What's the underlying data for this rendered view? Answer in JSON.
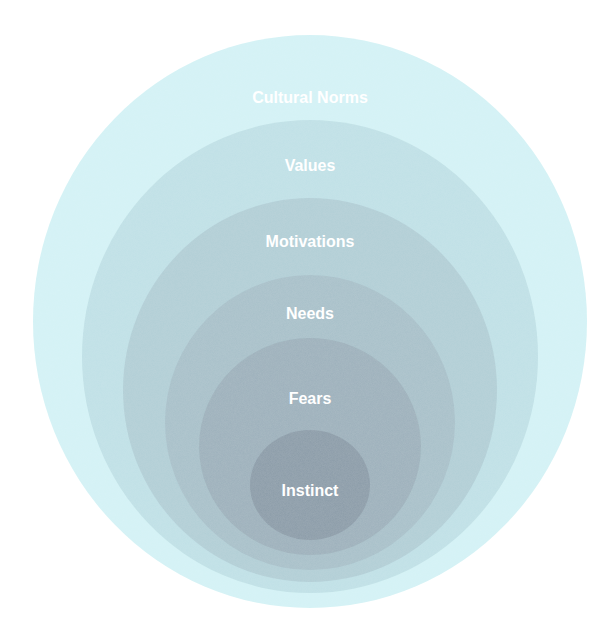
{
  "diagram": {
    "type": "nested-circles",
    "layers": [
      {
        "label": "Cultural Norms",
        "color": "#d3f2f5",
        "cx": 310,
        "cy": 321.5,
        "rx": 277,
        "ry": 286.5,
        "label_y": 97,
        "label_color": "#f2fbfc"
      },
      {
        "label": "Values",
        "color": "#bfe0e6",
        "cx": 310,
        "cy": 356.5,
        "rx": 228,
        "ry": 236.5,
        "label_y": 165,
        "label_color": "#f4fafb"
      },
      {
        "label": "Motivations",
        "color": "#b1ced6",
        "cx": 310,
        "cy": 390,
        "rx": 187,
        "ry": 192,
        "label_y": 241,
        "label_color": "#ffffff"
      },
      {
        "label": "Needs",
        "color": "#a7c0c9",
        "cx": 310,
        "cy": 422.5,
        "rx": 145,
        "ry": 147.5,
        "label_y": 313,
        "label_color": "#ffffff"
      },
      {
        "label": "Fears",
        "color": "#9cb0bb",
        "cx": 310,
        "cy": 446.5,
        "rx": 111,
        "ry": 108.5,
        "label_y": 398,
        "label_color": "#ffffff"
      },
      {
        "label": "Instinct",
        "color": "#8a9ba8",
        "cx": 310,
        "cy": 485,
        "rx": 60,
        "ry": 55,
        "label_y": 490,
        "label_color": "#ffffff"
      }
    ]
  }
}
